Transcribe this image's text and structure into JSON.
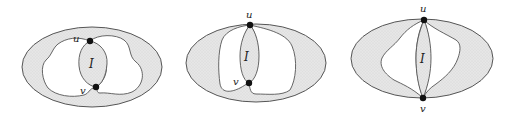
{
  "figure": {
    "fill_color": "#e3e3e3",
    "stroke_color": "#555555",
    "node_color": "#111111",
    "panels": [
      {
        "id": "panel-1",
        "vertex_u": "u",
        "vertex_v": "v",
        "region_label": "I"
      },
      {
        "id": "panel-2",
        "vertex_u": "u",
        "vertex_v": "v",
        "region_label": "I"
      },
      {
        "id": "panel-3",
        "vertex_u": "u",
        "vertex_v": "v",
        "region_label": "I"
      }
    ]
  }
}
